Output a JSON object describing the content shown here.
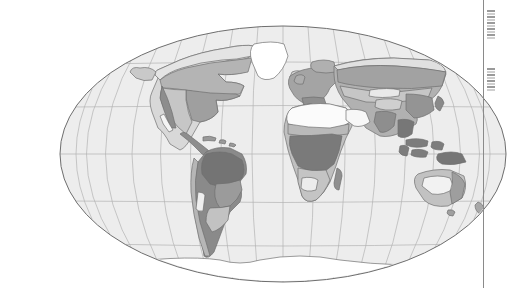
{
  "figure": {
    "kind": "world-map",
    "projection": "Mollweide elliptical equal-area",
    "title": "",
    "caption": "",
    "graticule": {
      "meridian_spacing_deg": 20,
      "parallel_spacing_deg": 30,
      "parallels_shown": [
        "60N",
        "30N",
        "0",
        "30S",
        "60S"
      ],
      "line_color": "#b3b3b3"
    },
    "palette": {
      "ocean": "#ededed",
      "ellipse_outline": "#6e6e6e",
      "coastline": "#707070",
      "ice_white": "#ffffff",
      "desert_pale": "#f6f6f6",
      "tone_light": "#d8d8d8",
      "tone_mid_light": "#c4c4c4",
      "tone_mid": "#ababab",
      "tone_mid_dark": "#9a9a9a",
      "tone_dark": "#878787",
      "tone_darkest": "#767676"
    },
    "zones": [
      {
        "name": "polar-ice",
        "tone": "#ffffff",
        "regions": [
          "Greenland",
          "Antarctica"
        ]
      },
      {
        "name": "tundra",
        "tone": "#d8d8d8",
        "regions": [
          "Arctic Canada",
          "Arctic Siberia"
        ]
      },
      {
        "name": "boreal-forest",
        "tone": "#ababab",
        "regions": [
          "Canada",
          "Siberia",
          "Fennoscandia"
        ]
      },
      {
        "name": "temperate-forest",
        "tone": "#9a9a9a",
        "regions": [
          "Eastern North America",
          "Europe",
          "East Asia"
        ]
      },
      {
        "name": "grassland-steppe",
        "tone": "#c4c4c4",
        "regions": [
          "Great Plains",
          "Central Asia",
          "Pampas"
        ]
      },
      {
        "name": "desert",
        "tone": "#f6f6f6",
        "regions": [
          "Sahara",
          "Arabia",
          "Australia interior",
          "Atacama"
        ]
      },
      {
        "name": "savanna",
        "tone": "#c4c4c4",
        "regions": [
          "Sahel",
          "Southern Africa",
          "Northern Australia"
        ]
      },
      {
        "name": "tropical-rainforest",
        "tone": "#767676",
        "regions": [
          "Amazon",
          "Congo",
          "Southeast Asia",
          "New Guinea"
        ]
      }
    ],
    "landmasses": [
      "North America",
      "South America",
      "Greenland",
      "Europe",
      "Africa",
      "Asia",
      "Australia",
      "New Zealand",
      "Antarctica",
      "Madagascar",
      "Indonesia",
      "New Guinea",
      "Japan",
      "British Isles",
      "Iceland"
    ]
  },
  "page": {
    "gutter_rule_color": "#8a8a8a",
    "margin_fragment_visible": true
  }
}
